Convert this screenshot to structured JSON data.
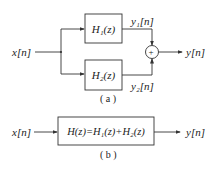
{
  "diagram_a": {
    "input_label": "x[n]",
    "block1_label": "H₁(z)",
    "block2_label": "H₂(z)",
    "branch1_output": "y₁[n]",
    "branch2_output": "y₂[n]",
    "sum_symbol": "+",
    "output_label": "y[n]",
    "caption": "( a )"
  },
  "diagram_b": {
    "input_label": "x[n]",
    "block_label": "H(z)=H₁(z)+H₂(z)",
    "output_label": "y[n]",
    "caption": "( b )"
  },
  "colors": {
    "line": "#333333",
    "background": "#ffffff"
  }
}
